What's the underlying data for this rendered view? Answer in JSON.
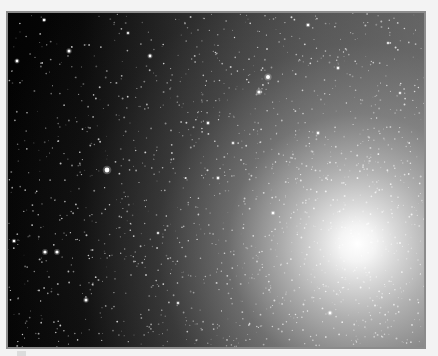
{
  "image": {
    "subject": "galaxy core with surrounding star field",
    "palette": {
      "page_background": "#f3f3f3",
      "frame_border": "#8c8c8c",
      "space_dark": "#030303",
      "core_glow": "#ffffff"
    },
    "core_center": {
      "x_pct": 84,
      "y_pct": 69
    },
    "bright_stars": [
      {
        "x": 99,
        "y": 157,
        "r": 2.4
      },
      {
        "x": 260,
        "y": 64,
        "r": 2.0
      },
      {
        "x": 251,
        "y": 79,
        "r": 1.6
      },
      {
        "x": 61,
        "y": 38,
        "r": 1.5
      },
      {
        "x": 9,
        "y": 48,
        "r": 1.4
      },
      {
        "x": 36,
        "y": 7,
        "r": 1.2
      },
      {
        "x": 142,
        "y": 43,
        "r": 1.4
      },
      {
        "x": 37,
        "y": 239,
        "r": 1.6
      },
      {
        "x": 49,
        "y": 239,
        "r": 1.6
      },
      {
        "x": 78,
        "y": 287,
        "r": 1.5
      },
      {
        "x": 6,
        "y": 228,
        "r": 1.3
      },
      {
        "x": 300,
        "y": 12,
        "r": 1.3
      },
      {
        "x": 330,
        "y": 55,
        "r": 1.2
      },
      {
        "x": 200,
        "y": 110,
        "r": 1.2
      },
      {
        "x": 225,
        "y": 130,
        "r": 1.1
      },
      {
        "x": 310,
        "y": 120,
        "r": 1.2
      },
      {
        "x": 210,
        "y": 165,
        "r": 1.2
      },
      {
        "x": 265,
        "y": 200,
        "r": 1.3
      },
      {
        "x": 322,
        "y": 300,
        "r": 1.4
      },
      {
        "x": 170,
        "y": 290,
        "r": 1.1
      },
      {
        "x": 120,
        "y": 20,
        "r": 1.1
      },
      {
        "x": 380,
        "y": 30,
        "r": 1.0
      },
      {
        "x": 392,
        "y": 80,
        "r": 1.0
      },
      {
        "x": 150,
        "y": 220,
        "r": 1.0
      }
    ]
  }
}
